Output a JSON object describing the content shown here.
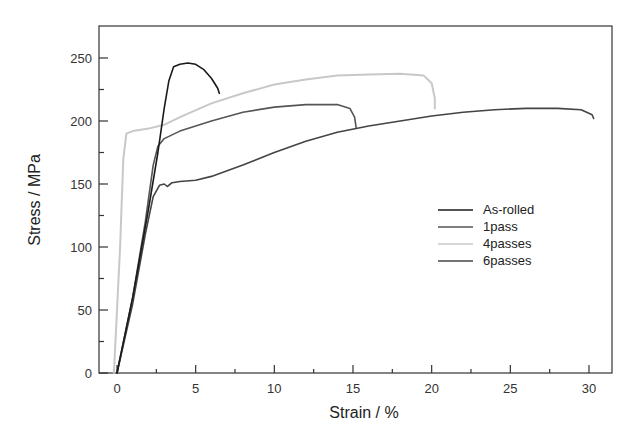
{
  "chart_data": {
    "type": "line",
    "title": "",
    "xlabel": "Strain / %",
    "ylabel": "Stress / MPa",
    "xlim": [
      -1.5,
      31.5
    ],
    "ylim": [
      0,
      275
    ],
    "x_ticks": [
      0,
      5,
      10,
      15,
      20,
      25,
      30
    ],
    "y_ticks": [
      0,
      50,
      100,
      150,
      200,
      250
    ],
    "grid": false,
    "legend_position": "center-right",
    "series": [
      {
        "name": "As-rolled",
        "color": "#1a1a1a",
        "points": [
          [
            0,
            0
          ],
          [
            1,
            60
          ],
          [
            2,
            130
          ],
          [
            2.6,
            175
          ],
          [
            3,
            210
          ],
          [
            3.3,
            232
          ],
          [
            3.6,
            243
          ],
          [
            4,
            245
          ],
          [
            4.5,
            246
          ],
          [
            5,
            245
          ],
          [
            5.5,
            241
          ],
          [
            6,
            234
          ],
          [
            6.4,
            226
          ],
          [
            6.5,
            222
          ]
        ]
      },
      {
        "name": "1pass",
        "color": "#555555",
        "points": [
          [
            0,
            0
          ],
          [
            1,
            60
          ],
          [
            1.8,
            120
          ],
          [
            2.3,
            165
          ],
          [
            2.6,
            180
          ],
          [
            3,
            186
          ],
          [
            4,
            192
          ],
          [
            6,
            200
          ],
          [
            8,
            207
          ],
          [
            10,
            211
          ],
          [
            12,
            213
          ],
          [
            14,
            213
          ],
          [
            14.8,
            210
          ],
          [
            15.1,
            203
          ],
          [
            15.2,
            195
          ]
        ]
      },
      {
        "name": "4passes",
        "color": "#c8c8c8",
        "points": [
          [
            -0.2,
            0
          ],
          [
            0.2,
            100
          ],
          [
            0.4,
            170
          ],
          [
            0.6,
            190
          ],
          [
            1,
            192
          ],
          [
            2,
            194
          ],
          [
            3,
            197
          ],
          [
            4,
            203
          ],
          [
            6,
            214
          ],
          [
            8,
            222
          ],
          [
            10,
            229
          ],
          [
            12,
            233
          ],
          [
            14,
            236
          ],
          [
            16,
            237
          ],
          [
            18,
            237.5
          ],
          [
            19.5,
            236
          ],
          [
            20,
            230
          ],
          [
            20.2,
            218
          ],
          [
            20.2,
            210
          ]
        ]
      },
      {
        "name": "6passes",
        "color": "#444444",
        "points": [
          [
            0,
            0
          ],
          [
            1,
            55
          ],
          [
            1.8,
            110
          ],
          [
            2.3,
            140
          ],
          [
            2.7,
            149
          ],
          [
            3,
            150
          ],
          [
            3.2,
            148
          ],
          [
            3.5,
            151
          ],
          [
            4,
            152
          ],
          [
            5,
            153
          ],
          [
            6,
            156
          ],
          [
            8,
            165
          ],
          [
            10,
            175
          ],
          [
            12,
            184
          ],
          [
            14,
            191
          ],
          [
            16,
            196
          ],
          [
            18,
            200
          ],
          [
            20,
            204
          ],
          [
            22,
            207
          ],
          [
            24,
            209
          ],
          [
            26,
            210
          ],
          [
            28,
            210
          ],
          [
            29.5,
            209
          ],
          [
            30.2,
            205
          ],
          [
            30.3,
            202
          ]
        ]
      }
    ]
  },
  "axes": {
    "x_title": "Strain / %",
    "y_title": "Stress / MPa"
  },
  "legend": {
    "items": [
      {
        "label": "As-rolled",
        "color": "#1a1a1a"
      },
      {
        "label": "1pass",
        "color": "#555555"
      },
      {
        "label": "4passes",
        "color": "#c8c8c8"
      },
      {
        "label": "6passes",
        "color": "#444444"
      }
    ]
  }
}
